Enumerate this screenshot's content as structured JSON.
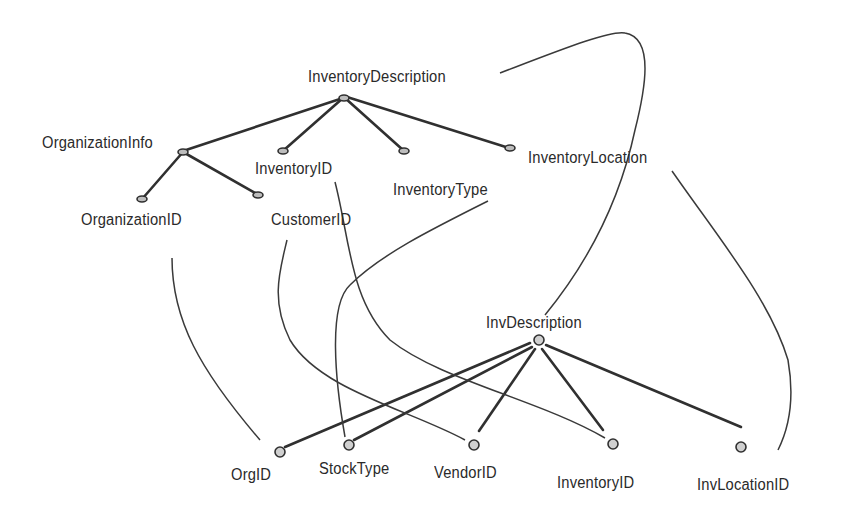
{
  "diagram": {
    "type": "schema-matching",
    "source_schema": {
      "root": "InventoryDescription",
      "nodes": [
        {
          "id": "InventoryDescription",
          "label": "InventoryDescription",
          "parent": null
        },
        {
          "id": "OrganizationInfo",
          "label": "OrganizationInfo",
          "parent": "InventoryDescription"
        },
        {
          "id": "InventoryID_src",
          "label": "InventoryID",
          "parent": "InventoryDescription"
        },
        {
          "id": "InventoryType",
          "label": "InventoryType",
          "parent": "InventoryDescription"
        },
        {
          "id": "InventoryLocation",
          "label": "InventoryLocation",
          "parent": "InventoryDescription"
        },
        {
          "id": "OrganizationID",
          "label": "OrganizationID",
          "parent": "OrganizationInfo"
        },
        {
          "id": "CustomerID",
          "label": "CustomerID",
          "parent": "OrganizationInfo"
        }
      ]
    },
    "target_schema": {
      "root": "InvDescription",
      "nodes": [
        {
          "id": "InvDescription",
          "label": "InvDescription",
          "parent": null
        },
        {
          "id": "OrgID",
          "label": "OrgID",
          "parent": "InvDescription"
        },
        {
          "id": "StockType",
          "label": "StockType",
          "parent": "InvDescription"
        },
        {
          "id": "VendorID",
          "label": "VendorID",
          "parent": "InvDescription"
        },
        {
          "id": "InventoryID_tgt",
          "label": "InventoryID",
          "parent": "InvDescription"
        },
        {
          "id": "InvLocationID",
          "label": "InvLocationID",
          "parent": "InvDescription"
        }
      ]
    },
    "correspondences": [
      {
        "from": "InventoryDescription",
        "to": "InvDescription"
      },
      {
        "from": "OrganizationID",
        "to": "OrgID"
      },
      {
        "from": "CustomerID",
        "to": "VendorID"
      },
      {
        "from": "InventoryID_src",
        "to": "InventoryID_tgt"
      },
      {
        "from": "InventoryType",
        "to": "StockType"
      },
      {
        "from": "InventoryLocation",
        "to": "InvLocationID"
      }
    ],
    "labels": {
      "inventory_description": "InventoryDescription",
      "organization_info": "OrganizationInfo",
      "inventory_id_src": "InventoryID",
      "inventory_type": "InventoryType",
      "inventory_location": "InventoryLocation",
      "organization_id": "OrganizationID",
      "customer_id": "CustomerID",
      "inv_description": "InvDescription",
      "org_id": "OrgID",
      "stock_type": "StockType",
      "vendor_id": "VendorID",
      "inventory_id_tgt": "InventoryID",
      "inv_location_id": "InvLocationID"
    },
    "colors": {
      "line": "#303030",
      "text": "#2a2a2a",
      "node_fill": "#c4c4c4",
      "background": "#ffffff"
    }
  }
}
